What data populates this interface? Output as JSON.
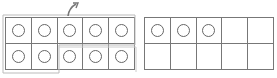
{
  "figure": {
    "frames": [
      {
        "id": "left",
        "rows": 2,
        "cols": 5,
        "counters": [
          1,
          1,
          1,
          1,
          1,
          1,
          1,
          1,
          1,
          1
        ],
        "count": 10
      },
      {
        "id": "right",
        "rows": 2,
        "cols": 5,
        "counters": [
          1,
          1,
          1,
          0,
          0,
          0,
          0,
          0,
          0,
          0
        ],
        "count": 3
      }
    ],
    "annotations": {
      "grouping_outline": "top row + first two cells of bottom row",
      "arrow": "curved arrow above third column pointing up-right",
      "outline_color": "#bbbbbb",
      "line_color": "#777777"
    }
  }
}
